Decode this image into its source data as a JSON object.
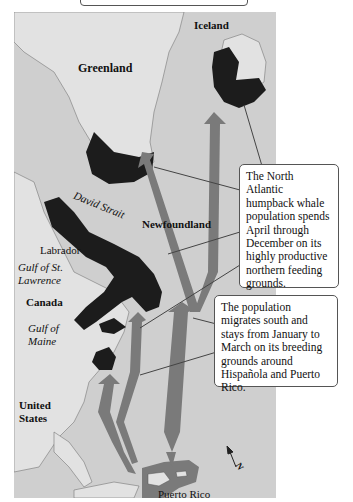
{
  "figure": {
    "colors": {
      "ocean": "#cfcfcf",
      "land": "#e2e2e2",
      "feeding_grounds": "#1c1c1c",
      "migration_arrows": "#7a7a7a",
      "breeding_area": "#7a7a7a",
      "callout_border": "#555555"
    }
  },
  "labels": {
    "iceland": "Iceland",
    "greenland": "Greenland",
    "david_strait": "David Strait",
    "newfoundland": "Newfoundland",
    "labrador": "Labrador",
    "gulf_st_lawrence_1": "Gulf of St.",
    "gulf_st_lawrence_2": "Lawrence",
    "canada": "Canada",
    "gulf_maine_1": "Gulf of",
    "gulf_maine_2": "Maine",
    "united_states_1": "United",
    "united_states_2": "States",
    "puerto_rico": "Puerto Rico",
    "north_arrow": "N"
  },
  "callouts": {
    "feeding": "The North Atlantic humpback whale population spends April through December on its highly productive northern feeding grounds.",
    "breeding": "The population migrates south and stays from January to March on its breeding grounds around Hispañola and Puerto Rico."
  }
}
